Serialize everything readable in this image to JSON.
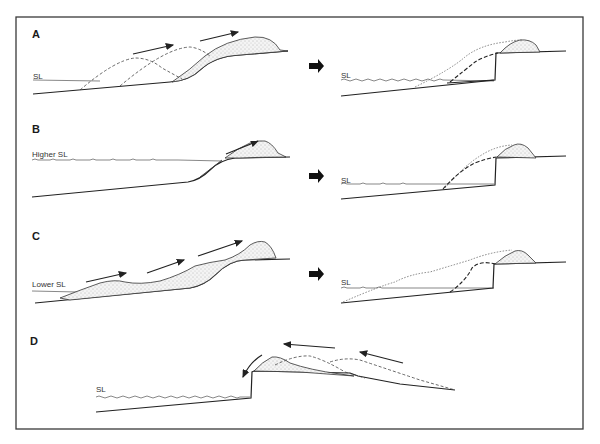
{
  "figure": {
    "frame_color": "#3a3a3a",
    "panels": [
      {
        "id": "A",
        "label": "A",
        "sea_level_label": "SL",
        "has_transition_arrow": true,
        "transition_icon": "right-arrow-icon"
      },
      {
        "id": "B",
        "label": "B",
        "sea_level_label": "Higher SL",
        "after_sea_level_label": "SL",
        "has_transition_arrow": true,
        "transition_icon": "right-arrow-icon"
      },
      {
        "id": "C",
        "label": "C",
        "sea_level_label": "Lower SL",
        "after_sea_level_label": "SL",
        "has_transition_arrow": true,
        "transition_icon": "right-arrow-icon"
      },
      {
        "id": "D",
        "label": "D",
        "sea_level_label": "SL",
        "has_transition_arrow": false
      }
    ],
    "panel_A_after_sl": "SL"
  }
}
